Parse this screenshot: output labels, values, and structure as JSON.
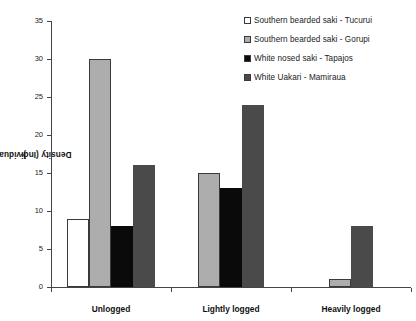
{
  "chart_data": {
    "type": "bar",
    "title": "",
    "xlabel": "",
    "ylabel": "Density (Individuals/km2)",
    "ylabel_base": "Density (Individuals/km",
    "ylabel_sup": "2",
    "ylabel_tail": ")",
    "categories": [
      "Unlogged",
      "Lightly logged",
      "Heavily logged"
    ],
    "ylim": [
      0,
      35
    ],
    "yticks": [
      0,
      5,
      10,
      15,
      20,
      25,
      30,
      35
    ],
    "ytick_labels": [
      "0",
      "5",
      "10",
      "15",
      "20",
      "25",
      "30",
      "35"
    ],
    "grid": false,
    "legend_position": "top-right",
    "series": [
      {
        "name": "Southern bearded saki - Tucurui",
        "color": "#ffffff",
        "edge": "#3a3a3a",
        "values": [
          9,
          null,
          null
        ]
      },
      {
        "name": "Southern bearded saki - Gorupi",
        "color": "#adadad",
        "edge": "#3a3a3a",
        "values": [
          30,
          15,
          1
        ]
      },
      {
        "name": "White nosed saki - Tapajos",
        "color": "#0a0a0a",
        "edge": "#0a0a0a",
        "values": [
          8,
          13,
          null
        ]
      },
      {
        "name": "White Uakari - Mamiraua",
        "color": "#4a4a4a",
        "edge": "#4a4a4a",
        "values": [
          16,
          24,
          8
        ]
      }
    ]
  },
  "legend": {
    "items": [
      {
        "label": "Southern bearded saki - Tucurui",
        "color": "#ffffff",
        "edge": "#3a3a3a"
      },
      {
        "label": "Southern bearded saki - Gorupi",
        "color": "#adadad",
        "edge": "#3a3a3a"
      },
      {
        "label": "White nosed saki - Tapajos",
        "color": "#0a0a0a",
        "edge": "#0a0a0a"
      },
      {
        "label": "White Uakari - Mamiraua",
        "color": "#4a4a4a",
        "edge": "#4a4a4a"
      }
    ]
  },
  "colors": {
    "axis": "#444444",
    "text": "#222222",
    "background": "#ffffff"
  }
}
